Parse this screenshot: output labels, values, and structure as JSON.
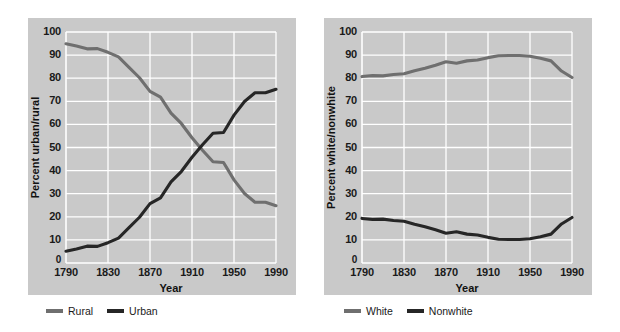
{
  "figure": {
    "background": "#ffffff",
    "panel_background": "#c9c9c9",
    "gridline_color": "#ffffff"
  },
  "charts": [
    {
      "id": "urban-rural",
      "xlabel": "Year",
      "ylabel": "Percent urban/rural",
      "xticks": [
        "1790",
        "1830",
        "1870",
        "1910",
        "1950",
        "1990"
      ],
      "yticks": [
        "0",
        "10",
        "20",
        "30",
        "40",
        "50",
        "60",
        "70",
        "80",
        "90",
        "100"
      ],
      "legend": [
        {
          "label": "Rural",
          "color": "#6f6f6f"
        },
        {
          "label": "Urban",
          "color": "#262626"
        }
      ]
    },
    {
      "id": "white-nonwhite",
      "xlabel": "Year",
      "ylabel": "Percent white/nonwhite",
      "xticks": [
        "1790",
        "1830",
        "1870",
        "1910",
        "1950",
        "1990"
      ],
      "yticks": [
        "0",
        "10",
        "20",
        "30",
        "40",
        "50",
        "60",
        "70",
        "80",
        "90",
        "100"
      ],
      "legend": [
        {
          "label": "White",
          "color": "#6f6f6f"
        },
        {
          "label": "Nonwhite",
          "color": "#262626"
        }
      ]
    }
  ],
  "chart_data": [
    {
      "type": "line",
      "id": "urban-rural",
      "title": "",
      "xlabel": "Year",
      "ylabel": "Percent urban/rural",
      "xlim": [
        1790,
        1990
      ],
      "ylim": [
        0,
        100
      ],
      "grid": true,
      "legend_position": "below",
      "xticks": [
        1790,
        1830,
        1870,
        1910,
        1950,
        1990
      ],
      "yticks": [
        0,
        10,
        20,
        30,
        40,
        50,
        60,
        70,
        80,
        90,
        100
      ],
      "x": [
        1790,
        1800,
        1810,
        1820,
        1830,
        1840,
        1850,
        1860,
        1870,
        1880,
        1890,
        1900,
        1910,
        1920,
        1930,
        1940,
        1950,
        1960,
        1970,
        1980,
        1990
      ],
      "series": [
        {
          "name": "Rural",
          "color": "#6f6f6f",
          "values": [
            94.9,
            93.9,
            92.7,
            92.8,
            91.2,
            89.2,
            84.7,
            80.2,
            74.3,
            71.8,
            64.9,
            60.3,
            54.2,
            48.8,
            43.8,
            43.5,
            36.0,
            30.1,
            26.3,
            26.3,
            24.8
          ]
        },
        {
          "name": "Urban",
          "color": "#262626",
          "values": [
            5.1,
            6.1,
            7.3,
            7.2,
            8.8,
            10.8,
            15.3,
            19.8,
            25.7,
            28.2,
            35.1,
            39.7,
            45.8,
            51.2,
            56.2,
            56.5,
            64.0,
            69.9,
            73.7,
            73.7,
            75.2
          ]
        }
      ]
    },
    {
      "type": "line",
      "id": "white-nonwhite",
      "title": "",
      "xlabel": "Year",
      "ylabel": "Percent white/nonwhite",
      "xlim": [
        1790,
        1990
      ],
      "ylim": [
        0,
        100
      ],
      "grid": true,
      "legend_position": "below",
      "xticks": [
        1790,
        1830,
        1870,
        1910,
        1950,
        1990
      ],
      "yticks": [
        0,
        10,
        20,
        30,
        40,
        50,
        60,
        70,
        80,
        90,
        100
      ],
      "x": [
        1790,
        1800,
        1810,
        1820,
        1830,
        1840,
        1850,
        1860,
        1870,
        1880,
        1890,
        1900,
        1910,
        1920,
        1930,
        1940,
        1950,
        1960,
        1970,
        1980,
        1990
      ],
      "series": [
        {
          "name": "White",
          "color": "#6f6f6f",
          "values": [
            80.7,
            81.1,
            81.0,
            81.6,
            81.9,
            83.2,
            84.3,
            85.6,
            87.1,
            86.5,
            87.5,
            87.9,
            88.9,
            89.7,
            89.8,
            89.8,
            89.5,
            88.6,
            87.5,
            83.1,
            80.3
          ]
        },
        {
          "name": "Nonwhite",
          "color": "#262626",
          "values": [
            19.3,
            18.9,
            19.0,
            18.4,
            18.1,
            16.8,
            15.7,
            14.4,
            12.9,
            13.5,
            12.5,
            12.1,
            11.1,
            10.3,
            10.2,
            10.2,
            10.5,
            11.4,
            12.5,
            16.9,
            19.7
          ]
        }
      ]
    }
  ]
}
